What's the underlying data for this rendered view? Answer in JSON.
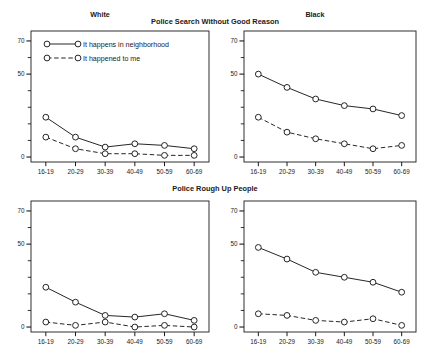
{
  "figure": {
    "row_titles": [
      "Police Search Without Good Reason",
      "Police Rough Up People"
    ],
    "col_titles": [
      "White",
      "Black"
    ]
  },
  "legend": {
    "items": [
      {
        "label": "It happens in neighborhood",
        "style": "solid"
      },
      {
        "label": "It happened to me",
        "style": "dashed"
      }
    ]
  },
  "axis": {
    "x_tick_labels": [
      "16-19",
      "20-29",
      "30-39",
      "40-49",
      "50-59",
      "60-69"
    ],
    "y_tick_labels": [
      "0",
      "50",
      "70"
    ],
    "y_tick_values": [
      0,
      50,
      70
    ],
    "y_minor_values": [
      10,
      20,
      30,
      40,
      60
    ],
    "ylim": [
      -3,
      76
    ]
  },
  "chart_data": [
    {
      "type": "line",
      "title": "Police Search Without Good Reason",
      "panel": "White",
      "row": 0,
      "col": 0,
      "xlabel": "",
      "ylabel": "",
      "categories": [
        "16-19",
        "20-29",
        "30-39",
        "40-49",
        "50-59",
        "60-69"
      ],
      "ylim": [
        -3,
        76
      ],
      "grid": false,
      "legend": "top-left",
      "series": [
        {
          "name": "It happens in neighborhood",
          "style": "solid",
          "values": [
            24,
            12,
            6,
            8,
            7,
            5
          ]
        },
        {
          "name": "It happened to me",
          "style": "dashed",
          "values": [
            12,
            5,
            2,
            2,
            1,
            1
          ]
        }
      ]
    },
    {
      "type": "line",
      "title": "Police Search Without Good Reason",
      "panel": "Black",
      "row": 0,
      "col": 1,
      "xlabel": "",
      "ylabel": "",
      "categories": [
        "16-19",
        "20-29",
        "30-39",
        "40-49",
        "50-59",
        "60-69"
      ],
      "ylim": [
        -3,
        76
      ],
      "grid": false,
      "legend": "none",
      "series": [
        {
          "name": "It happens in neighborhood",
          "style": "solid",
          "values": [
            50,
            42,
            35,
            31,
            29,
            25
          ]
        },
        {
          "name": "It happened to me",
          "style": "dashed",
          "values": [
            24,
            15,
            11,
            8,
            5,
            7
          ]
        }
      ]
    },
    {
      "type": "line",
      "title": "Police Rough Up People",
      "panel": "White",
      "row": 1,
      "col": 0,
      "xlabel": "",
      "ylabel": "",
      "categories": [
        "16-19",
        "20-29",
        "30-39",
        "40-49",
        "50-59",
        "60-69"
      ],
      "ylim": [
        -3,
        76
      ],
      "grid": false,
      "legend": "none",
      "series": [
        {
          "name": "It happens in neighborhood",
          "style": "solid",
          "values": [
            24,
            15,
            7,
            6,
            8,
            4
          ]
        },
        {
          "name": "It happened to me",
          "style": "dashed",
          "values": [
            3,
            1,
            3,
            0,
            1,
            0
          ]
        }
      ]
    },
    {
      "type": "line",
      "title": "Police Rough Up People",
      "panel": "Black",
      "row": 1,
      "col": 1,
      "xlabel": "",
      "ylabel": "",
      "categories": [
        "16-19",
        "20-29",
        "30-39",
        "40-49",
        "50-59",
        "60-69"
      ],
      "ylim": [
        -3,
        76
      ],
      "grid": false,
      "legend": "none",
      "series": [
        {
          "name": "It happens in neighborhood",
          "style": "solid",
          "values": [
            48,
            41,
            33,
            30,
            27,
            21
          ]
        },
        {
          "name": "It happened to me",
          "style": "dashed",
          "values": [
            8,
            7,
            4,
            3,
            5,
            1
          ]
        }
      ]
    }
  ],
  "style": {
    "line_color": "#1a1a1a",
    "marker_fill": "#ffffff",
    "frame_color": "#1a1a1a",
    "background": "#ffffff"
  }
}
